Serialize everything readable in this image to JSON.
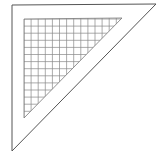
{
  "icon": {
    "name": "set-square-triangle-ruler-icon",
    "stroke_color": "#555555",
    "grid_color": "#777777",
    "background": "#ffffff",
    "outer_triangle": [
      [
        12,
        5
      ],
      [
        156,
        4
      ],
      [
        12,
        151
      ]
    ],
    "inner_triangle": [
      [
        24,
        19
      ],
      [
        122,
        18
      ],
      [
        24,
        118
      ]
    ],
    "grid_cell_px": 7.1
  }
}
